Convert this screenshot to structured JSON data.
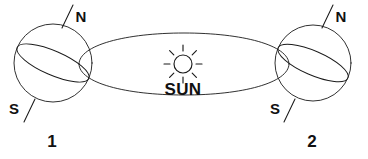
{
  "diagram": {
    "background_color": "#ffffff",
    "stroke_color": "#1a1a1a",
    "sun": {
      "label": "SUN",
      "icon": "sun-icon",
      "center_x": 183,
      "center_y": 64,
      "radius": 9,
      "ray_count": 8,
      "label_x": 183,
      "label_y": 94
    },
    "orbit": {
      "name": "orbit-ellipse",
      "center_x": 184,
      "center_y": 64,
      "radius_x": 105,
      "radius_y": 31
    },
    "earths": [
      {
        "id": "earth-position-1",
        "index_label": "1",
        "north_label": "N",
        "south_label": "S",
        "center_x": 53,
        "center_y": 63,
        "radius": 39,
        "axis_tilt_deg": -23.5,
        "index_label_x": 52,
        "index_label_y": 144,
        "north_label_x": 81,
        "north_label_y": 17,
        "south_label_x": 13,
        "south_label_y": 115
      },
      {
        "id": "earth-position-2",
        "index_label": "2",
        "north_label": "N",
        "south_label": "S",
        "center_x": 313,
        "center_y": 63,
        "radius": 38,
        "axis_tilt_deg": -23.5,
        "index_label_x": 312,
        "index_label_y": 144,
        "north_label_x": 341,
        "north_label_y": 17,
        "south_label_x": 274,
        "south_label_y": 115
      }
    ]
  }
}
